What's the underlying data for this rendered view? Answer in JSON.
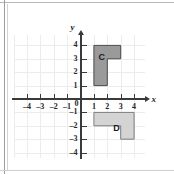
{
  "figure": {
    "background_color": "#ffffff",
    "frame_color": "#b8b8b8",
    "grid_color": "#ececec",
    "axis_color": "#3a3a3a"
  },
  "axes": {
    "x_label": "x",
    "y_label": "y",
    "origin_label": "0",
    "x_ticks": [
      "–4",
      "–3",
      "–2",
      "–1",
      "1",
      "2",
      "3",
      "4"
    ],
    "x_tick_values": [
      -4,
      -3,
      -2,
      -1,
      1,
      2,
      3,
      4
    ],
    "y_ticks": [
      "4",
      "3",
      "2",
      "1",
      "–1",
      "–2",
      "–3",
      "–4"
    ],
    "y_tick_values": [
      4,
      3,
      2,
      1,
      -1,
      -2,
      -3,
      -4
    ],
    "xlim": [
      -5,
      5
    ],
    "ylim": [
      -4.5,
      5
    ]
  },
  "shapes": [
    {
      "label": "C",
      "fill": "#9a9a9a",
      "stroke": "#4a4a4a",
      "label_color": "#1a1a1a",
      "label_point": [
        1.35,
        3.45
      ],
      "vertices": [
        [
          1,
          1
        ],
        [
          1,
          4
        ],
        [
          3,
          4
        ],
        [
          3,
          3
        ],
        [
          2,
          3
        ],
        [
          2,
          1
        ]
      ]
    },
    {
      "label": "D",
      "fill": "#d4d4d4",
      "stroke": "#7d7d7d",
      "label_color": "#1a1a1a",
      "label_point": [
        2.45,
        -1.85
      ],
      "vertices": [
        [
          1,
          -1
        ],
        [
          4,
          -1
        ],
        [
          4,
          -3
        ],
        [
          3,
          -3
        ],
        [
          3,
          -2
        ],
        [
          1,
          -2
        ]
      ]
    }
  ],
  "chart_data": {
    "type": "scatter",
    "xlabel": "x",
    "ylabel": "y",
    "xlim": [
      -5,
      5
    ],
    "ylim": [
      -4.5,
      5
    ],
    "grid": true,
    "legend": "none",
    "x_tick_labels": [
      "–4",
      "–3",
      "–2",
      "–1",
      "0",
      "1",
      "2",
      "3",
      "4"
    ],
    "y_tick_labels": [
      "–4",
      "–3",
      "–2",
      "–1",
      "0",
      "1",
      "2",
      "3",
      "4"
    ],
    "annotations": [
      {
        "text": "C",
        "x": 1.35,
        "y": 3.45
      },
      {
        "text": "D",
        "x": 2.45,
        "y": -1.85
      }
    ],
    "series": [
      {
        "name": "C",
        "type": "polygon",
        "fill": "#9a9a9a",
        "points": [
          [
            1,
            1
          ],
          [
            1,
            4
          ],
          [
            3,
            4
          ],
          [
            3,
            3
          ],
          [
            2,
            3
          ],
          [
            2,
            1
          ]
        ]
      },
      {
        "name": "D",
        "type": "polygon",
        "fill": "#d4d4d4",
        "points": [
          [
            1,
            -1
          ],
          [
            4,
            -1
          ],
          [
            4,
            -3
          ],
          [
            3,
            -3
          ],
          [
            3,
            -2
          ],
          [
            1,
            -2
          ]
        ]
      }
    ]
  }
}
